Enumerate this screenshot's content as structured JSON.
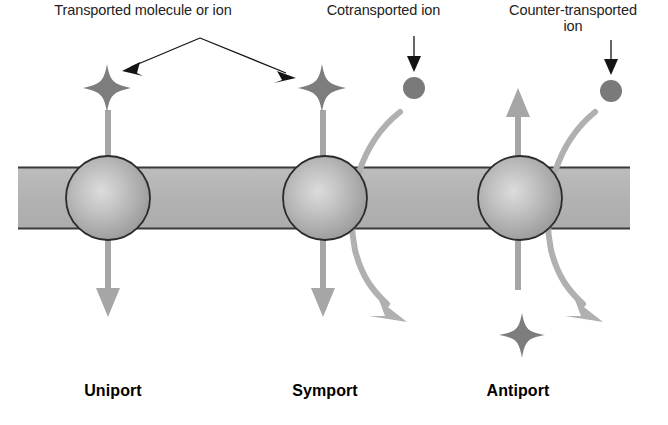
{
  "figure": {
    "width": 668,
    "height": 425,
    "background": "#ffffff"
  },
  "colors": {
    "membrane_fill": "#b4b4b4",
    "membrane_stroke": "#3c3c3c",
    "protein_fill": "#a8a8a8",
    "protein_highlight": "#d8d8d8",
    "protein_stroke": "#2b2b2b",
    "gray_arrow": "#a6a6a6",
    "curved_arrow": "#b0b0b0",
    "star_fill": "#7d7d7d",
    "ion_fill": "#7a7a7a",
    "pointer_black": "#151515",
    "label_top_text": "#232323",
    "label_bottom_text": "#000000"
  },
  "labels": {
    "top": [
      {
        "id": "transported-molecule",
        "text": "Transported molecule or ion"
      },
      {
        "id": "cotransported-ion",
        "text": "Cotransported ion"
      },
      {
        "id": "counter-transported-ion",
        "text": "Counter-transported\nion"
      }
    ],
    "bottom": [
      {
        "id": "uniport",
        "text": "Uniport"
      },
      {
        "id": "symport",
        "text": "Symport"
      },
      {
        "id": "antiport",
        "text": "Antiport"
      }
    ]
  },
  "membrane": {
    "name": "lipid-bilayer",
    "x": 18,
    "y": 167,
    "width": 612,
    "height": 62
  },
  "transporters": [
    {
      "id": "uniport",
      "name": "uniport-protein",
      "cx": 108,
      "cy": 198,
      "r": 42,
      "cargo": "four-pointed-star",
      "transport_direction": "downward",
      "second_solute": "none"
    },
    {
      "id": "symport",
      "name": "symport-protein",
      "cx": 325,
      "cy": 198,
      "r": 42,
      "cargo": "four-pointed-star",
      "transport_direction": "downward",
      "second_solute": "ion-downward-same-direction"
    },
    {
      "id": "antiport",
      "name": "antiport-protein",
      "cx": 520,
      "cy": 198,
      "r": 42,
      "cargo": "four-pointed-star",
      "transport_direction": "upward",
      "second_solute": "ion-downward-opposite-direction"
    }
  ],
  "solutes": {
    "stars": [
      {
        "id": "uniport-star-top",
        "cx": 107,
        "cy": 88,
        "size": 24
      },
      {
        "id": "symport-star-top",
        "cx": 322,
        "cy": 88,
        "size": 24
      },
      {
        "id": "antiport-star-bottom",
        "cx": 522,
        "cy": 335,
        "size": 24
      }
    ],
    "ions": [
      {
        "id": "cotransported-ion-circle",
        "cx": 414,
        "cy": 88,
        "r": 11
      },
      {
        "id": "counter-transported-ion-circle",
        "cx": 611,
        "cy": 91,
        "r": 11
      }
    ]
  },
  "pointers": {
    "branching": {
      "apex_x": 200,
      "apex_y": 38,
      "left_tip_x": 125,
      "left_tip_y": 70,
      "right_tip_x": 293,
      "right_tip_y": 77
    },
    "cotransported": {
      "x": 414,
      "y_start": 36,
      "y_end": 68
    },
    "counter": {
      "x": 611,
      "y_start": 40,
      "y_end": 71
    }
  }
}
